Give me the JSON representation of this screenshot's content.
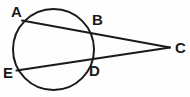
{
  "figure": {
    "background_color": "#fefefe",
    "stroke_color": "#1a1a1a",
    "label_color": "#1a1a1a",
    "width": 190,
    "height": 97
  },
  "labels": {
    "a": "A",
    "b": "B",
    "c": "C",
    "d": "D",
    "e": "E"
  },
  "geometry": {
    "circle": {
      "cx": 53.5,
      "cy": 49.5,
      "r": 40.5,
      "stroke_width": 2
    },
    "points": {
      "A": {
        "x": 22,
        "y": 20.5
      },
      "B": {
        "x": 90,
        "y": 31.5
      },
      "C": {
        "x": 170,
        "y": 47.5
      },
      "D": {
        "x": 87.5,
        "y": 62
      },
      "E": {
        "x": 16.5,
        "y": 70.5
      }
    },
    "segments": [
      {
        "name": "secant-A-C",
        "from": "A",
        "to": "C",
        "stroke_width": 2
      },
      {
        "name": "secant-E-C",
        "from": "E",
        "to": "C",
        "stroke_width": 2
      }
    ]
  }
}
